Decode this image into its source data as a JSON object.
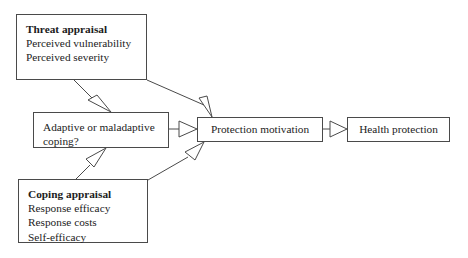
{
  "diagram": {
    "stroke_color": "#4a4a4a",
    "text_color": "#1c1c1c",
    "background_color": "#ffffff",
    "nodes": {
      "threat_appraisal": {
        "heading": "Threat appraisal",
        "items": [
          "Perceived vulnerability",
          "Perceived severity"
        ]
      },
      "adaptive_coping": {
        "line1": "Adaptive or maladaptive",
        "line2": "coping?"
      },
      "coping_appraisal": {
        "heading": "Coping appraisal",
        "items": [
          "Response efficacy",
          "Response costs",
          "Self-efficacy"
        ]
      },
      "protection_motivation": {
        "label": "Protection motivation"
      },
      "health_protection": {
        "label": "Health protection"
      }
    },
    "edges": [
      {
        "id": "threat-to-adaptive",
        "from": "threat_appraisal",
        "to": "adaptive_coping",
        "style": "open-arrow"
      },
      {
        "id": "threat-to-protection",
        "from": "threat_appraisal",
        "to": "protection_motivation",
        "style": "open-arrow"
      },
      {
        "id": "adaptive-to-protection",
        "from": "adaptive_coping",
        "to": "protection_motivation",
        "style": "open-arrow"
      },
      {
        "id": "coping-to-adaptive",
        "from": "coping_appraisal",
        "to": "adaptive_coping",
        "style": "open-arrow"
      },
      {
        "id": "coping-to-protection",
        "from": "coping_appraisal",
        "to": "protection_motivation",
        "style": "open-arrow"
      },
      {
        "id": "protection-to-health",
        "from": "protection_motivation",
        "to": "health_protection",
        "style": "open-arrow"
      }
    ]
  }
}
